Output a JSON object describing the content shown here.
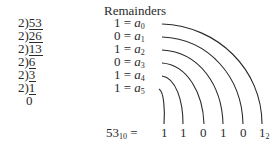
{
  "title": "Remainders",
  "divisions": [
    {
      "divisor": "2",
      "dividend": "53"
    },
    {
      "divisor": "2",
      "dividend": "26"
    },
    {
      "divisor": "2",
      "dividend": "13"
    },
    {
      "divisor": "2",
      "dividend": "6"
    },
    {
      "divisor": "2",
      "dividend": "3"
    },
    {
      "divisor": "2",
      "dividend": "1"
    }
  ],
  "final_quotient": "0",
  "remainders": [
    {
      "value": "1",
      "eq": "=",
      "var": "a",
      "index": "0"
    },
    {
      "value": "0",
      "eq": "=",
      "var": "a",
      "index": "1"
    },
    {
      "value": "1",
      "eq": "=",
      "var": "a",
      "index": "2"
    },
    {
      "value": "0",
      "eq": "=",
      "var": "a",
      "index": "3"
    },
    {
      "value": "1",
      "eq": "=",
      "var": "a",
      "index": "4"
    },
    {
      "value": "1",
      "eq": "=",
      "var": "a",
      "index": "5"
    }
  ],
  "result": {
    "decimal": "53",
    "decimal_base": "10",
    "eq": "=",
    "binary_digits": [
      "1",
      "1",
      "0",
      "1",
      "0",
      "1"
    ],
    "binary_base": "2"
  },
  "colors": {
    "ink": "#2a2a2a",
    "background": "#ffffff"
  }
}
